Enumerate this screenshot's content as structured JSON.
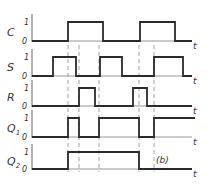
{
  "figure": {
    "label": "(b)",
    "axis_label": "t",
    "level_high": "1",
    "level_low": "0"
  },
  "signals": [
    {
      "name": "C",
      "sub": "",
      "high_y": 22,
      "low_y": 41,
      "edges": [
        [
          68,
          103
        ],
        [
          140,
          175
        ]
      ]
    },
    {
      "name": "S",
      "sub": "",
      "high_y": 57,
      "low_y": 76,
      "edges": [
        [
          53,
          76
        ],
        [
          100,
          122
        ],
        [
          154,
          183
        ]
      ]
    },
    {
      "name": "R",
      "sub": "",
      "high_y": 88,
      "low_y": 106,
      "edges": [
        [
          79,
          95
        ],
        [
          133,
          147
        ]
      ]
    },
    {
      "name": "Q",
      "sub": "1",
      "high_y": 118,
      "low_y": 137,
      "edges": [
        [
          68,
          79
        ],
        [
          99,
          139
        ],
        [
          154,
          195
        ]
      ]
    },
    {
      "name": "Q",
      "sub": "2",
      "high_y": 152,
      "low_y": 169,
      "edges": [
        [
          68,
          139
        ]
      ]
    }
  ],
  "dashed_lines_x": [
    68,
    79,
    99,
    139,
    154
  ],
  "chart_data": {
    "type": "timing",
    "title": "",
    "xlabel": "t",
    "series": [
      {
        "name": "C",
        "pulses": [
          [
            68,
            103
          ],
          [
            140,
            175
          ]
        ]
      },
      {
        "name": "S",
        "pulses": [
          [
            53,
            76
          ],
          [
            100,
            122
          ],
          [
            154,
            183
          ]
        ]
      },
      {
        "name": "R",
        "pulses": [
          [
            79,
            95
          ],
          [
            133,
            147
          ]
        ]
      },
      {
        "name": "Q1",
        "pulses": [
          [
            68,
            79
          ],
          [
            99,
            139
          ],
          [
            154,
            195
          ]
        ]
      },
      {
        "name": "Q2",
        "pulses": [
          [
            68,
            139
          ]
        ]
      }
    ],
    "levels": [
      "0",
      "1"
    ],
    "annotation": "(b)"
  }
}
